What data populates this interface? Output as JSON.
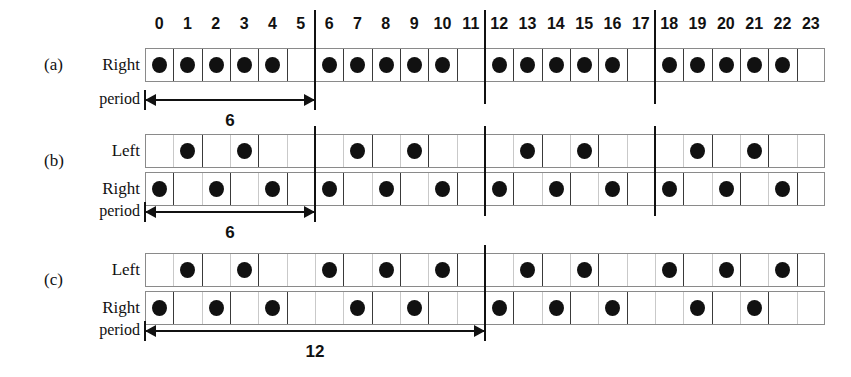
{
  "figure": {
    "column_count": 24,
    "column_headers": [
      "0",
      "1",
      "2",
      "3",
      "4",
      "5",
      "6",
      "7",
      "8",
      "9",
      "10",
      "11",
      "12",
      "13",
      "14",
      "15",
      "16",
      "17",
      "18",
      "19",
      "20",
      "21",
      "22",
      "23"
    ],
    "period_label": "period",
    "dot_color": "#111111",
    "grid_color": "#3a3a3a",
    "separator_color": "#111111"
  },
  "panels": [
    {
      "tag": "(a)",
      "rows": [
        {
          "name": "Right",
          "filled": [
            0,
            1,
            2,
            3,
            4,
            6,
            7,
            8,
            9,
            10,
            12,
            13,
            14,
            15,
            16,
            18,
            19,
            20,
            21,
            22
          ]
        }
      ],
      "period_label": "period",
      "period_value": "6",
      "period_span_cells": 6,
      "separators_at": [
        6,
        12,
        18
      ]
    },
    {
      "tag": "(b)",
      "rows": [
        {
          "name": "Left",
          "filled": [
            1,
            3,
            7,
            9,
            13,
            15,
            19,
            21
          ]
        },
        {
          "name": "Right",
          "filled": [
            0,
            2,
            4,
            6,
            8,
            10,
            12,
            14,
            16,
            18,
            20,
            22
          ]
        }
      ],
      "period_label": "period",
      "period_value": "6",
      "period_span_cells": 6,
      "separators_at": [
        6,
        12,
        18
      ]
    },
    {
      "tag": "(c)",
      "rows": [
        {
          "name": "Left",
          "filled": [
            1,
            3,
            6,
            8,
            10,
            13,
            15,
            18,
            20,
            22
          ]
        },
        {
          "name": "Right",
          "filled": [
            0,
            2,
            4,
            7,
            9,
            12,
            14,
            16,
            19,
            21
          ]
        }
      ],
      "period_label": "period",
      "period_value": "12",
      "period_span_cells": 12,
      "separators_at": [
        12
      ]
    }
  ]
}
